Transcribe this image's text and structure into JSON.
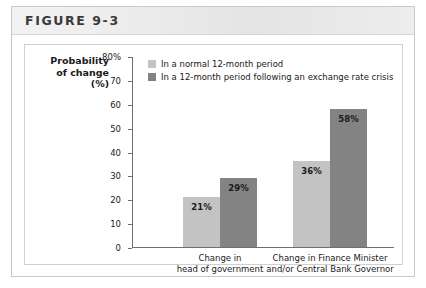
{
  "figure": {
    "header_label": "FIGURE 9-3"
  },
  "chart_data": {
    "type": "bar",
    "title": "",
    "xlabel": "",
    "ylabel": "Probability of change (%)",
    "ylabel_lines": [
      "Probability",
      "of change",
      "(%)"
    ],
    "ylim": [
      0,
      80
    ],
    "grid": false,
    "legend_position": "top-left-inside",
    "categories": [
      "Change in head of government",
      "Change in Finance Minister and/or Central Bank Governor"
    ],
    "category_lines": [
      [
        "Change in",
        "head of government"
      ],
      [
        "Change in Finance Minister",
        "and/or Central Bank Governor"
      ]
    ],
    "tick_labels": [
      "80%",
      "70",
      "60",
      "50",
      "40",
      "30",
      "20",
      "10",
      "0"
    ],
    "tick_values": [
      80,
      70,
      60,
      50,
      40,
      30,
      20,
      10,
      0
    ],
    "series": [
      {
        "name": "In a normal 12-month period",
        "color": "#c3c3c3",
        "values": [
          21,
          36
        ],
        "value_labels": [
          "21%",
          "36%"
        ]
      },
      {
        "name": "In a 12-month period following an exchange rate crisis",
        "color": "#838383",
        "values": [
          29,
          58
        ],
        "value_labels": [
          "29%",
          "58%"
        ]
      }
    ]
  }
}
